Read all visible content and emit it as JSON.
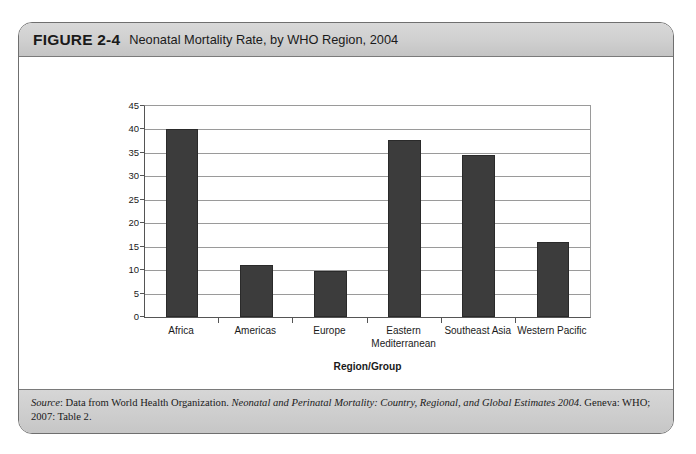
{
  "figure": {
    "number_label": "FIGURE 2-4",
    "title": "Neonatal Mortality Rate, by WHO Region, 2004",
    "source_prefix": "Source",
    "source_colon": ": Data from World Health Organization. ",
    "source_italic_title": "Neonatal and Perinatal Mortality: Country, Regional, and Global Estimates 2004",
    "source_tail": ". Geneva: WHO; 2007: Table 2.",
    "frame_border_color": "#6f6f6f",
    "band_color": "#cfcfcf"
  },
  "chart_data": {
    "type": "bar",
    "title": "Neonatal Mortality Rate, by WHO Region, 2004",
    "xlabel": "Region/Group",
    "ylabel": "Deaths per 1000 Live Births",
    "categories": [
      "Africa",
      "Americas",
      "Europe",
      "Eastern Mediterranean",
      "Southeast Asia",
      "Western Pacific"
    ],
    "category_lines": [
      [
        "Africa"
      ],
      [
        "Americas"
      ],
      [
        "Europe"
      ],
      [
        "Eastern",
        "Mediterranean"
      ],
      [
        "Southeast Asia"
      ],
      [
        "Western Pacific"
      ]
    ],
    "values": [
      40,
      11,
      9.8,
      37.8,
      34.5,
      16
    ],
    "ylim": [
      0,
      45
    ],
    "yticks": [
      0,
      5,
      10,
      15,
      20,
      25,
      30,
      35,
      40,
      45
    ],
    "ytick_labels": [
      "0",
      "5",
      "10",
      "15",
      "20",
      "25",
      "30",
      "35",
      "40",
      "45"
    ],
    "grid": true,
    "legend": "none",
    "bar_color": "#3c3c3c",
    "gridline_color": "#9a9a9a"
  }
}
